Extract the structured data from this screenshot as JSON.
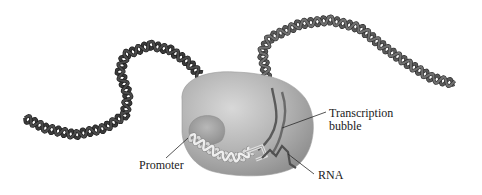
{
  "figure": {
    "labels": {
      "promoter": "Promoter",
      "transcription_bubble_line1": "Transcription",
      "transcription_bubble_line2": "bubble",
      "rna": "RNA"
    },
    "elements": [
      {
        "name": "dna-double-helix-upstream",
        "description": "dark DNA double helix entering enzyme from left"
      },
      {
        "name": "dna-double-helix-downstream",
        "description": "DNA double helix exiting enzyme to upper right"
      },
      {
        "name": "rna-polymerase",
        "description": "gray enzyme blob"
      },
      {
        "name": "promoter-region",
        "description": "light unwound DNA at promoter"
      },
      {
        "name": "transcription-bubble",
        "description": "separated DNA strands inside enzyme"
      },
      {
        "name": "rna-strand",
        "description": "nascent RNA transcript"
      }
    ],
    "colors": {
      "dna_dark": "#3a3a3a",
      "dna_mid": "#5a5a5a",
      "dna_light": "#d8d8d8",
      "enzyme_light": "#c9c9c9",
      "enzyme_dark": "#8f8f8f",
      "leader_line": "#2a2a2a"
    }
  }
}
